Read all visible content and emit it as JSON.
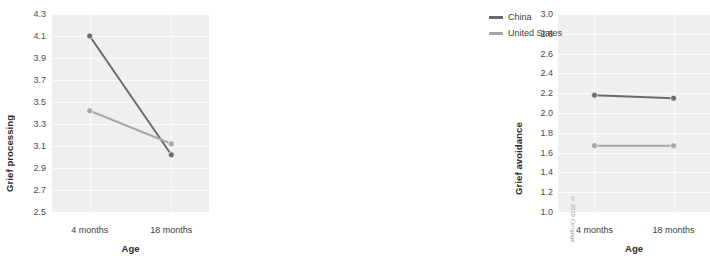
{
  "legend": {
    "position": "right",
    "items": [
      {
        "label": "China",
        "color": "#6b6b6b"
      },
      {
        "label": "United States",
        "color": "#a8a8a8"
      }
    ]
  },
  "credit": "© 2019 Cengage",
  "axis": {
    "x_title": "Age",
    "x_categories": [
      "4 months",
      "18 months"
    ]
  },
  "chart_data": [
    {
      "type": "line",
      "panel": "left",
      "title": "",
      "xlabel": "Age",
      "ylabel": "Grief processing",
      "categories": [
        "4 months",
        "18 months"
      ],
      "x": [
        4,
        18
      ],
      "ylim": [
        2.5,
        4.3
      ],
      "yticks": [
        "4.3",
        "4.1",
        "3.9",
        "3.7",
        "3.5",
        "3.3",
        "3.1",
        "2.9",
        "2.7",
        "2.5"
      ],
      "ytick_values": [
        4.3,
        4.1,
        3.9,
        3.7,
        3.5,
        3.3,
        3.1,
        2.9,
        2.7,
        2.5
      ],
      "grid": true,
      "markers": true,
      "series": [
        {
          "name": "China",
          "color": "#6b6b6b",
          "values": [
            4.1,
            3.02
          ]
        },
        {
          "name": "United States",
          "color": "#a8a8a8",
          "values": [
            3.42,
            3.12
          ]
        }
      ]
    },
    {
      "type": "line",
      "panel": "right",
      "title": "",
      "xlabel": "Age",
      "ylabel": "Grief avoidance",
      "categories": [
        "4 months",
        "18 months"
      ],
      "x": [
        4,
        18
      ],
      "ylim": [
        1.0,
        3.0
      ],
      "yticks": [
        "3.0",
        "2.8",
        "2.6",
        "2.4",
        "2.2",
        "2.0",
        "1.8",
        "1.6",
        "1.4",
        "1.2",
        "1.0"
      ],
      "ytick_values": [
        3.0,
        2.8,
        2.6,
        2.4,
        2.2,
        2.0,
        1.8,
        1.6,
        1.4,
        1.2,
        1.0
      ],
      "grid": true,
      "markers": true,
      "series": [
        {
          "name": "China",
          "color": "#6b6b6b",
          "values": [
            2.18,
            2.15
          ]
        },
        {
          "name": "United States",
          "color": "#a8a8a8",
          "values": [
            1.67,
            1.67
          ]
        }
      ]
    }
  ]
}
